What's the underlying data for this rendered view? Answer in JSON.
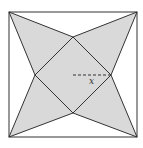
{
  "diagram": {
    "outer_square": {
      "x1": 9,
      "y1": 12,
      "x2": 137,
      "y2": 137
    },
    "inner_square": {
      "top": [
        73,
        37
      ],
      "right": [
        111,
        75
      ],
      "bottom": [
        73,
        113
      ],
      "left": [
        35,
        75
      ]
    },
    "dashed_segment": {
      "from": [
        73,
        75
      ],
      "to": [
        111,
        75
      ]
    },
    "label": {
      "text": "x",
      "x": 90,
      "y": 83
    },
    "colors": {
      "fill": "#d9d9d9",
      "stroke": "#333333",
      "background": "#ffffff"
    }
  }
}
